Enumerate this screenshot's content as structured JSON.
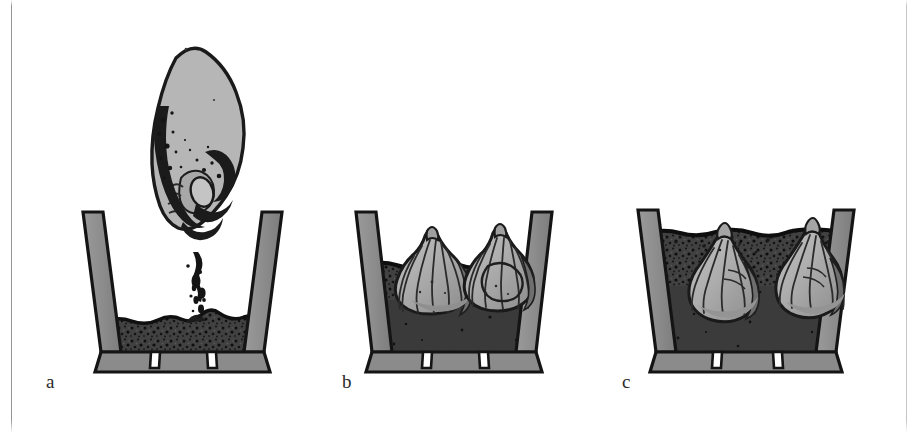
{
  "figure": {
    "type": "instructional-illustration",
    "background_color": "#ffffff",
    "width": 918,
    "height": 433
  },
  "palette": {
    "outline": "#1b1b1b",
    "pot_wall": "#8c8c8c",
    "pot_wall_shadow": "#787878",
    "soil_dark": "#3c3c3c",
    "soil_mid": "#4a4a4a",
    "soil_speckle": "#111111",
    "bulb_light": "#b2b2b2",
    "bulb_mid": "#9a9a9a",
    "bulb_shade": "#6e6e6e",
    "hand_light": "#b4b4b4",
    "page_rule": "#828282"
  },
  "panels": [
    {
      "id": "a",
      "label": "a",
      "caption_text": "a",
      "description": "A hand crumbles potting compost into a tapered pot that is part filled with soil",
      "elements": {
        "pot": "tapered-pot-empty-upper",
        "soil_fill_level": "low",
        "hand": "hand-dropping-soil",
        "falling_soil": "soil-stream"
      }
    },
    {
      "id": "b",
      "label": "b",
      "caption_text": "b",
      "description": "Two bulbs set upright, base down, on the levelled compost surface",
      "elements": {
        "pot": "tapered-pot",
        "soil_fill_level": "half",
        "bulbs": 2,
        "bulb_state": "resting-on-surface"
      }
    },
    {
      "id": "c",
      "label": "c",
      "caption_text": "c",
      "description": "More compost added so the bulbs are buried with only their tips showing",
      "elements": {
        "pot": "tapered-pot",
        "soil_fill_level": "full",
        "bulbs": 2,
        "bulb_state": "buried-tips-exposed"
      }
    }
  ]
}
